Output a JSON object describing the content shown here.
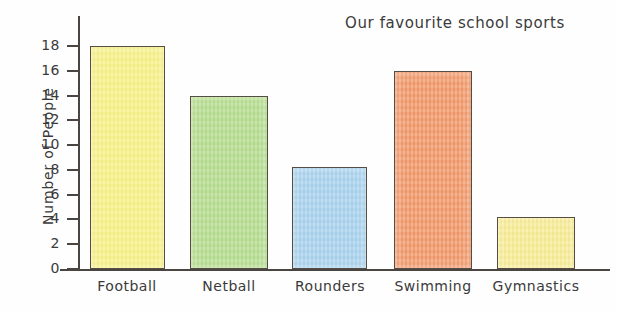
{
  "chart_data": {
    "type": "bar",
    "title": "Our favourite school sports",
    "xlabel": "",
    "ylabel": "Number of People",
    "categories": [
      "Football",
      "Netball",
      "Rounders",
      "Swimming",
      "Gymnastics"
    ],
    "values": [
      18,
      14,
      8.2,
      16,
      4.2
    ],
    "bar_colors": [
      "#F7F287",
      "#B5DD8E",
      "#A9D3EE",
      "#F2996A",
      "#F8EC94"
    ],
    "ylim": [
      0,
      18
    ],
    "ytick_labels": [
      "0",
      "2",
      "4",
      "6",
      "8",
      "10",
      "12",
      "14",
      "16",
      "18"
    ],
    "ytick_values": [
      0,
      2,
      4,
      6,
      8,
      10,
      12,
      14,
      16,
      18
    ],
    "grid": false,
    "legend": false
  },
  "style": {
    "axis_color": "#4a4540",
    "text_color": "#3a3a3a",
    "background": "#fefefe"
  }
}
